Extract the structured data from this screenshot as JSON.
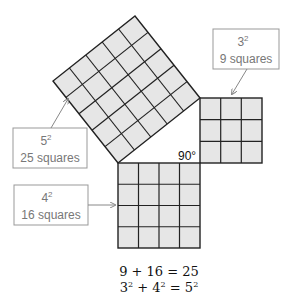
{
  "diagram": {
    "squares": [
      {
        "id": "hyp",
        "n": 5,
        "label_base": "5",
        "label_exp": "2",
        "label_text": "25 squares"
      },
      {
        "id": "short",
        "n": 3,
        "label_base": "3",
        "label_exp": "2",
        "label_text": "9 squares"
      },
      {
        "id": "long",
        "n": 4,
        "label_base": "4",
        "label_exp": "2",
        "label_text": "16 squares"
      }
    ],
    "angle_label": "90°",
    "equations": {
      "line1": "9 + 16 = 25",
      "line2_a": "3",
      "line2_b": " + 4",
      "line2_c": " = 5",
      "exp": "2"
    },
    "colors": {
      "fill": "#e6e6e6",
      "grid": "#222222",
      "label_border": "#999999"
    }
  }
}
